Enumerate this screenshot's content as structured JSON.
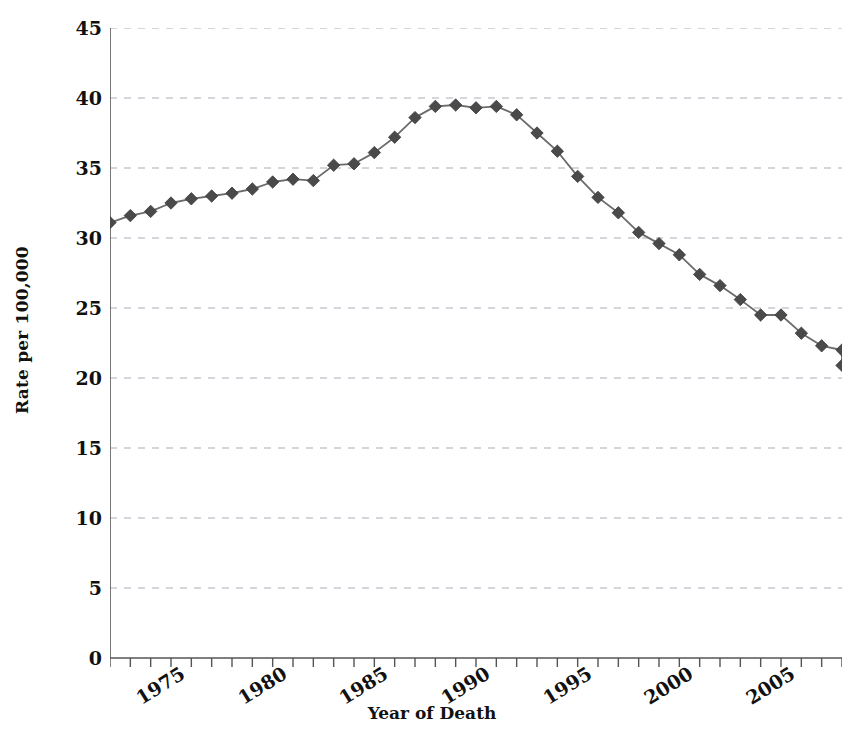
{
  "chart_data": {
    "type": "line",
    "title": "",
    "xlabel": "Year of Death",
    "ylabel": "Rate per 100,000",
    "xlim": [
      1975,
      2011
    ],
    "ylim": [
      0,
      45
    ],
    "grid": true,
    "legend": false,
    "marker": "diamond",
    "line_color": "#6b6b6b",
    "marker_color": "#4a4a4a",
    "grid_color": "#c8c8cf",
    "axis_color": "#555555",
    "x": [
      1975,
      1976,
      1977,
      1978,
      1979,
      1980,
      1981,
      1982,
      1983,
      1984,
      1985,
      1986,
      1987,
      1988,
      1989,
      1990,
      1991,
      1992,
      1993,
      1994,
      1995,
      1996,
      1997,
      1998,
      1999,
      2000,
      2001,
      2002,
      2003,
      2004,
      2005,
      2006,
      2007,
      2008,
      2009,
      2010,
      2011
    ],
    "values": [
      31.1,
      31.6,
      31.9,
      32.5,
      32.8,
      33.0,
      33.2,
      33.5,
      34.0,
      34.2,
      34.1,
      35.2,
      35.3,
      36.1,
      37.2,
      38.6,
      39.4,
      39.5,
      39.3,
      39.4,
      38.8,
      37.5,
      36.2,
      34.4,
      32.9,
      31.8,
      30.4,
      29.6,
      28.8,
      27.4,
      26.6,
      25.6,
      24.5,
      24.5,
      23.2,
      22.3,
      22.0
    ],
    "last_value": 20.9,
    "xticks": [
      1975,
      1980,
      1985,
      1990,
      1995,
      2000,
      2005,
      2011
    ],
    "xtick_labels": [
      "1975",
      "1980",
      "1985",
      "1990",
      "1995",
      "2000",
      "2005",
      "2011"
    ],
    "yticks": [
      0,
      5,
      10,
      15,
      20,
      25,
      30,
      35,
      40,
      45
    ],
    "ytick_labels": [
      "0",
      "5",
      "10",
      "15",
      "20",
      "25",
      "30",
      "35",
      "40",
      "45"
    ],
    "y_minor_step": 1.25
  }
}
